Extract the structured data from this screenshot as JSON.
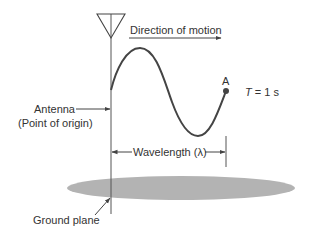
{
  "diagram": {
    "labels": {
      "direction": "Direction of motion",
      "point_a": "A",
      "period_var": "T",
      "period_val": " = 1 s",
      "antenna": "Antenna",
      "origin": "(Point of origin)",
      "wavelength": "Wavelength (λ)",
      "ground_plane": "Ground plane"
    },
    "colors": {
      "line": "#444444",
      "ground": "#b3b3b3",
      "text": "#333333"
    }
  }
}
